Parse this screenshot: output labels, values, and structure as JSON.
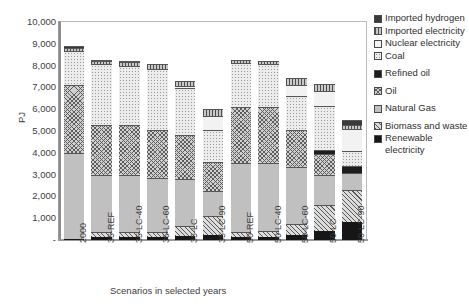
{
  "chart_data": {
    "type": "bar",
    "stacked": true,
    "title": "",
    "xlabel": "Scenarios in selected years",
    "ylabel": "PJ",
    "ylim": [
      0,
      10000
    ],
    "ytick_labels": [
      "10,000",
      "9,000",
      "8,000",
      "7,000",
      "6,000",
      "5,000",
      "4,000",
      "3,000",
      "2,000",
      "1,000",
      "-"
    ],
    "ytick_values": [
      10000,
      9000,
      8000,
      7000,
      6000,
      5000,
      4000,
      3000,
      2000,
      1000,
      0
    ],
    "grid": false,
    "legend_position": "right",
    "categories": [
      "2000",
      "35-REF",
      "35-LC-40",
      "35-LC-60",
      "35-LC",
      "35-LC-90",
      "50-REF",
      "50-LC-40",
      "50-LC-60",
      "50-LC",
      "50-LC-90"
    ],
    "series": [
      {
        "name": "Renewable electricity",
        "pattern": "renewable-electricity",
        "values": [
          60,
          140,
          150,
          150,
          190,
          250,
          150,
          160,
          230,
          400,
          820
        ]
      },
      {
        "name": "Biomass and waste",
        "pattern": "biomass-and-waste",
        "values": [
          0,
          220,
          220,
          220,
          470,
          830,
          230,
          240,
          490,
          1220,
          1480
        ]
      },
      {
        "name": "Natural Gas",
        "pattern": "natural-gas",
        "values": [
          3930,
          2640,
          2630,
          2470,
          2140,
          1170,
          3160,
          3150,
          2620,
          1370,
          760
        ]
      },
      {
        "name": "Oil",
        "pattern": "oil",
        "values": [
          3130,
          2300,
          2290,
          2230,
          2030,
          1330,
          2570,
          2540,
          1730,
          940,
          0
        ]
      },
      {
        "name": "Refined oil",
        "pattern": "refined-oil",
        "values": [
          0,
          0,
          0,
          0,
          0,
          0,
          0,
          0,
          0,
          220,
          330
        ]
      },
      {
        "name": "Coal",
        "pattern": "coal",
        "values": [
          1540,
          2760,
          2700,
          2760,
          2130,
          1450,
          2000,
          1970,
          1560,
          2000,
          680
        ]
      },
      {
        "name": "Nuclear electricity",
        "pattern": "nuclear-electricity",
        "values": [
          0,
          0,
          0,
          0,
          120,
          660,
          0,
          0,
          500,
          710,
          1020
        ]
      },
      {
        "name": "Imported electricity",
        "pattern": "imported-electricity",
        "values": [
          140,
          160,
          170,
          260,
          220,
          320,
          150,
          170,
          320,
          280,
          190
        ]
      },
      {
        "name": "Imported hydrogen",
        "pattern": "imported-hydrogen",
        "values": [
          100,
          60,
          60,
          0,
          0,
          0,
          0,
          0,
          0,
          0,
          230
        ]
      }
    ],
    "totals": [
      8900,
      8280,
      8220,
      8090,
      7300,
      6010,
      8260,
      8230,
      7450,
      7140,
      5510
    ]
  },
  "legend": {
    "items": [
      {
        "label_line1": "Imported",
        "label_line2": "hydrogen",
        "pattern": "imported-hydrogen",
        "gap_after": false
      },
      {
        "label_line1": "Imported",
        "label_line2": "electricity",
        "pattern": "imported-electricity",
        "gap_after": false
      },
      {
        "label_line1": "Nuclear",
        "label_line2": "electricity",
        "pattern": "nuclear-electricity",
        "gap_after": false
      },
      {
        "label_line1": "Coal",
        "label_line2": "",
        "pattern": "coal",
        "gap_after": true
      },
      {
        "label_line1": "Refined oil",
        "label_line2": "",
        "pattern": "refined-oil",
        "gap_after": true
      },
      {
        "label_line1": "Oil",
        "label_line2": "",
        "pattern": "oil",
        "gap_after": true
      },
      {
        "label_line1": "Natural Gas",
        "label_line2": "",
        "pattern": "natural-gas",
        "gap_after": true
      },
      {
        "label_line1": "Biomass and",
        "label_line2": "waste",
        "pattern": "biomass-and-waste",
        "gap_after": false
      },
      {
        "label_line1": "Renewable",
        "label_line2": "electricity",
        "pattern": "renewable-electricity",
        "gap_after": false
      }
    ]
  }
}
